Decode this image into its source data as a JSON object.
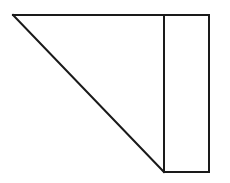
{
  "canvas": {
    "width": 230,
    "height": 183,
    "background_color": "#ffffff"
  },
  "figure": {
    "name": "right-triangle-with-adjacent-rectangle",
    "stroke_color": "#1a1a1a",
    "fill_color": "#ffffff",
    "stroke_width": 2,
    "vertices": {
      "top_left": [
        13,
        15
      ],
      "top_divider": [
        164,
        15
      ],
      "top_right": [
        209,
        15
      ],
      "bottom_divider": [
        164,
        172
      ],
      "bottom_right": [
        209,
        172
      ]
    },
    "parts": [
      {
        "name": "triangle",
        "shape": "polygon",
        "points": "13,15 164,15 164,172"
      },
      {
        "name": "rectangle",
        "shape": "polygon",
        "points": "164,15 209,15 209,172 164,172"
      }
    ],
    "edges": [
      {
        "name": "top-edge",
        "from": [
          13,
          15
        ],
        "to": [
          209,
          15
        ]
      },
      {
        "name": "hypotenuse-diagonal",
        "from": [
          13,
          15
        ],
        "to": [
          164,
          172
        ]
      },
      {
        "name": "vertical-divider",
        "from": [
          164,
          15
        ],
        "to": [
          164,
          172
        ]
      },
      {
        "name": "right-edge",
        "from": [
          209,
          15
        ],
        "to": [
          209,
          172
        ]
      },
      {
        "name": "bottom-edge",
        "from": [
          164,
          172
        ],
        "to": [
          209,
          172
        ]
      }
    ]
  }
}
